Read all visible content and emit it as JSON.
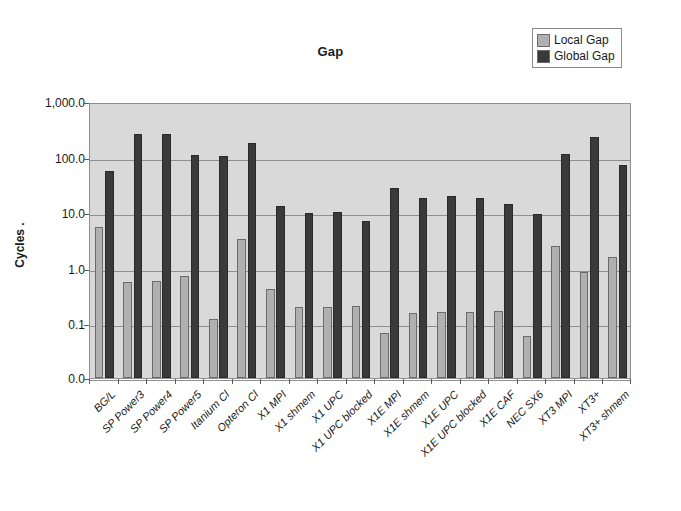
{
  "chart_data": {
    "type": "bar",
    "title": "Gap",
    "xlabel": "",
    "ylabel": "Cycles  .",
    "yscale": "log",
    "ylim": [
      0.0,
      1000.0
    ],
    "ytick_labels": [
      "1,000.0",
      "100.0",
      "10.0",
      "1.0",
      "0.1",
      "0.0"
    ],
    "ytick_values": [
      1000.0,
      100.0,
      10.0,
      1.0,
      0.1,
      0.0
    ],
    "grid": true,
    "legend_position": "top-right",
    "categories": [
      "BG/L",
      "SP Power3",
      "SP Power4",
      "SP Power5",
      "Itanium Cl",
      "Opteron Cl",
      "X1 MPI",
      "X1 shmem",
      "X1 UPC",
      "X1 UPC blocked",
      "X1E MPI",
      "X1E shmem",
      "X1E UPC",
      "X1E UPC blocked",
      "X1E CAF",
      "NEC SX6",
      "XT3 MPI",
      "XT3+",
      "XT3+ shmem"
    ],
    "series": [
      {
        "name": "Local Gap",
        "color": "#b0b0b0",
        "values": [
          5.5,
          0.58,
          0.6,
          0.72,
          0.125,
          3.4,
          0.43,
          0.2,
          0.2,
          0.21,
          0.068,
          0.16,
          0.165,
          0.165,
          0.175,
          0.06,
          2.5,
          0.85,
          1.6
        ]
      },
      {
        "name": "Global Gap",
        "color": "#3a3a3a",
        "values": [
          58.0,
          270.0,
          260.0,
          112.0,
          105.0,
          180.0,
          13.5,
          10.0,
          10.5,
          7.2,
          28.0,
          19.0,
          20.5,
          19.0,
          14.5,
          9.5,
          118.0,
          235.0,
          72.0
        ]
      }
    ]
  },
  "legend": {
    "items": [
      {
        "label": "Local Gap",
        "color": "#b0b0b0"
      },
      {
        "label": "Global Gap",
        "color": "#3a3a3a"
      }
    ]
  }
}
